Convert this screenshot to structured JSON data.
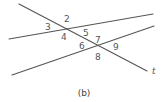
{
  "figure": {
    "caption": "(b)",
    "transversal_label": "t",
    "line_color": "#555555",
    "angle_labels": [
      {
        "id": "3",
        "text": "3",
        "x": 45,
        "y": 30
      },
      {
        "id": "2",
        "text": "2",
        "x": 64,
        "y": 22
      },
      {
        "id": "4",
        "text": "4",
        "x": 61,
        "y": 40
      },
      {
        "id": "5",
        "text": "5",
        "x": 83,
        "y": 36
      },
      {
        "id": "6",
        "text": "6",
        "x": 79,
        "y": 49
      },
      {
        "id": "7",
        "text": "7",
        "x": 95,
        "y": 43
      },
      {
        "id": "9",
        "text": "9",
        "x": 113,
        "y": 50
      },
      {
        "id": "8",
        "text": "8",
        "x": 95,
        "y": 60
      }
    ]
  }
}
